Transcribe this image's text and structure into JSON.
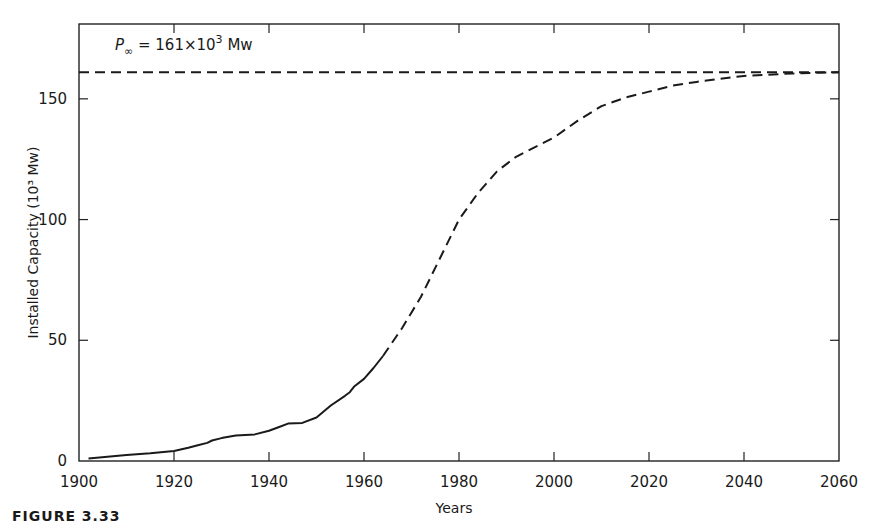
{
  "chart_data": {
    "type": "line",
    "title": "",
    "xlabel": "Years",
    "ylabel": "Installed Capacity (10³ Mw)",
    "xlim": [
      1900,
      2060
    ],
    "ylim": [
      0,
      181
    ],
    "x_ticks": [
      1900,
      1920,
      1940,
      1960,
      1980,
      2000,
      2020,
      2040,
      2060
    ],
    "y_ticks": [
      0,
      50,
      100,
      150
    ],
    "grid": false,
    "annotation": {
      "text_symbol": "P",
      "text_subscript": "∞",
      "text_rest": " = 161×10",
      "text_sup": "3",
      "text_unit": " Mw",
      "asymptote_value": 161
    },
    "series": [
      {
        "name": "historical",
        "style": "solid",
        "x": [
          1902,
          1906,
          1910,
          1915,
          1920,
          1923,
          1925,
          1927,
          1928,
          1930,
          1933,
          1937,
          1940,
          1942,
          1944,
          1947,
          1950,
          1953,
          1956,
          1957,
          1958,
          1960,
          1962,
          1964
        ],
        "y": [
          1.0,
          1.8,
          2.5,
          3.2,
          4.2,
          5.5,
          6.5,
          7.5,
          8.5,
          9.5,
          10.5,
          11.0,
          12.5,
          14.0,
          15.5,
          15.8,
          18.0,
          23.0,
          27.0,
          28.5,
          31.0,
          34.0,
          38.5,
          43.5
        ]
      },
      {
        "name": "logistic-projection",
        "style": "dashed",
        "x": [
          1964,
          1968,
          1972,
          1976,
          1980,
          1984,
          1988,
          1992,
          1996,
          2000,
          2005,
          2010,
          2015,
          2020,
          2025,
          2030,
          2040,
          2050,
          2060
        ],
        "y": [
          43.5,
          55,
          68,
          84,
          100,
          111,
          120,
          126,
          130,
          134,
          141,
          147,
          150.5,
          153,
          155.5,
          157,
          159.5,
          160.5,
          161
        ]
      },
      {
        "name": "saturation-asymptote",
        "style": "dashed",
        "x": [
          1900,
          2060
        ],
        "y": [
          161,
          161
        ]
      }
    ]
  },
  "caption": "FIGURE 3.33"
}
